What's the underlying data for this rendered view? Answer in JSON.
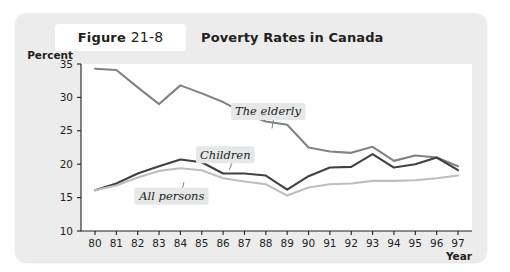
{
  "figure": {
    "label_prefix": "Figure",
    "number": "21-8",
    "title": "Poverty Rates in Canada"
  },
  "colors": {
    "card_background": "#edecec",
    "plot_background": "#ffffff",
    "axis": "#231f20",
    "elderly_line": "#808285",
    "children_line": "#414042",
    "all_persons_line": "#bcbec0",
    "series_label_background": "#e6e7e8"
  },
  "chart_data": {
    "type": "line",
    "title": "Poverty Rates in Canada",
    "xlabel": "Year",
    "ylabel": "Percent",
    "xlim": [
      80,
      97
    ],
    "ylim": [
      10,
      35
    ],
    "yticks": [
      10,
      15,
      20,
      25,
      30,
      35
    ],
    "grid": false,
    "legend_position": "inline-annotations",
    "x": [
      80,
      81,
      82,
      83,
      84,
      85,
      86,
      87,
      88,
      89,
      90,
      91,
      92,
      93,
      94,
      95,
      96,
      97
    ],
    "xticklabels": [
      "80",
      "81",
      "82",
      "83",
      "84",
      "85",
      "86",
      "87",
      "88",
      "89",
      "90",
      "91",
      "92",
      "93",
      "94",
      "95",
      "96",
      "97"
    ],
    "series": [
      {
        "name": "The elderly",
        "color": "#808285",
        "values": [
          34.3,
          34.1,
          31.5,
          29.0,
          31.8,
          30.6,
          29.3,
          27.6,
          26.4,
          25.9,
          22.5,
          21.9,
          21.7,
          22.6,
          20.5,
          21.3,
          21.0,
          19.7
        ]
      },
      {
        "name": "Children",
        "color": "#414042",
        "values": [
          16.1,
          17.1,
          18.6,
          19.7,
          20.7,
          20.3,
          18.6,
          18.6,
          18.3,
          16.2,
          18.2,
          19.5,
          19.6,
          21.5,
          19.5,
          20.0,
          21.0,
          19.1
        ]
      },
      {
        "name": "All persons",
        "color": "#bcbec0",
        "values": [
          16.1,
          16.8,
          18.0,
          19.0,
          19.4,
          19.1,
          17.9,
          17.4,
          17.0,
          15.3,
          16.5,
          17.0,
          17.1,
          17.5,
          17.5,
          17.6,
          17.9,
          18.3
        ]
      }
    ],
    "annotations": [
      {
        "text": "The elderly",
        "x": 88.1,
        "y": 27.9
      },
      {
        "text": "Children",
        "x": 86.1,
        "y": 21.4
      },
      {
        "text": "All persons",
        "x": 83.6,
        "y": 15.2
      }
    ]
  }
}
